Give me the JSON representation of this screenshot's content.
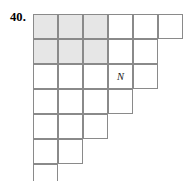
{
  "figure": {
    "problem_number": "40.",
    "type": "staircase-grid",
    "cell_size": 25,
    "columns": 6,
    "rows": 7,
    "row_lengths": [
      6,
      5,
      5,
      4,
      3,
      2,
      1
    ],
    "shaded_region": {
      "rows": [
        1,
        2
      ],
      "columns": [
        1,
        2,
        3
      ],
      "color": "#e6e6e6"
    },
    "grid_line_color": "#8a8a8a",
    "cell_background": "#ffffff",
    "labels": [
      {
        "text": "N",
        "row": 3,
        "column": 4
      }
    ]
  },
  "chart_data": {
    "type": "table",
    "title": "40.",
    "xlabel": "",
    "ylabel": "",
    "categories": [
      "row 1",
      "row 2",
      "row 3",
      "row 4",
      "row 5",
      "row 6",
      "row 7"
    ],
    "values": [
      6,
      5,
      5,
      4,
      3,
      2,
      1
    ],
    "annotations": [
      {
        "text": "N",
        "x": 4,
        "y": 3
      }
    ],
    "grid": true,
    "legend": "none"
  }
}
